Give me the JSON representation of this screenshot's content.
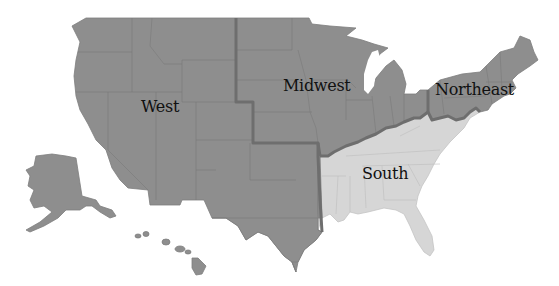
{
  "map": {
    "title": "US Census Regions",
    "colors": {
      "dark_region": "#8e8e8e",
      "light_region": "#d6d6d6",
      "region_border": "#6e6e6e",
      "background": "#ffffff"
    },
    "regions": [
      {
        "name": "West",
        "shade": "dark",
        "label_x": 141,
        "label_y": 97
      },
      {
        "name": "Midwest",
        "shade": "dark",
        "label_x": 283,
        "label_y": 76
      },
      {
        "name": "Northeast",
        "shade": "dark",
        "label_x": 435,
        "label_y": 80
      },
      {
        "name": "South",
        "shade": "light",
        "label_x": 362,
        "label_y": 164
      }
    ]
  }
}
